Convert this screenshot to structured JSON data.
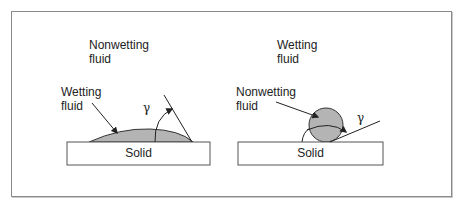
{
  "figure": {
    "left_panel": {
      "surrounding_fluid_label_line1": "Nonwetting",
      "surrounding_fluid_label_line2": "fluid",
      "droplet_label_line1": "Wetting",
      "droplet_label_line2": "fluid",
      "angle_symbol": "γ",
      "solid_label": "Solid"
    },
    "right_panel": {
      "surrounding_fluid_label_line1": "Wetting",
      "surrounding_fluid_label_line2": "fluid",
      "droplet_label_line1": "Nonwetting",
      "droplet_label_line2": "fluid",
      "angle_symbol": "γ",
      "solid_label": "Solid"
    },
    "colors": {
      "frame": "#8a8a8a",
      "fluid_fill": "#b4b4b4",
      "solid_fill": "#ffffff",
      "line": "#222222"
    }
  }
}
